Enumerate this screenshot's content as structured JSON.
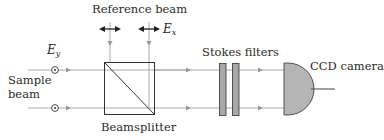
{
  "diagram": {
    "labels": {
      "reference_beam": "Reference beam",
      "sample_beam_line1": "Sample",
      "sample_beam_line2": "beam",
      "beamsplitter": "Beamsplitter",
      "stokes_filters": "Stokes filters",
      "ccd_camera": "CCD camera",
      "field_x_base": "E",
      "field_x_sub": "x",
      "field_y_base": "E",
      "field_y_sub": "y"
    },
    "components": [
      {
        "id": "reference-beam",
        "type": "input-beam",
        "polarization": "horizontal (E_x, in-plane double arrow)"
      },
      {
        "id": "sample-beam",
        "type": "input-beam",
        "polarization": "vertical (E_y, out-of-plane dot)"
      },
      {
        "id": "beamsplitter",
        "type": "cube-beamsplitter"
      },
      {
        "id": "stokes-filters",
        "type": "filter-pair",
        "count": 2
      },
      {
        "id": "ccd-camera",
        "type": "detector"
      }
    ],
    "colors": {
      "beam_line": "#aaaaaa",
      "outline": "#333333",
      "filter_fill": "#a8a8a8",
      "camera_fill": "#b5b5b5",
      "text": "#2a2a2a"
    }
  }
}
